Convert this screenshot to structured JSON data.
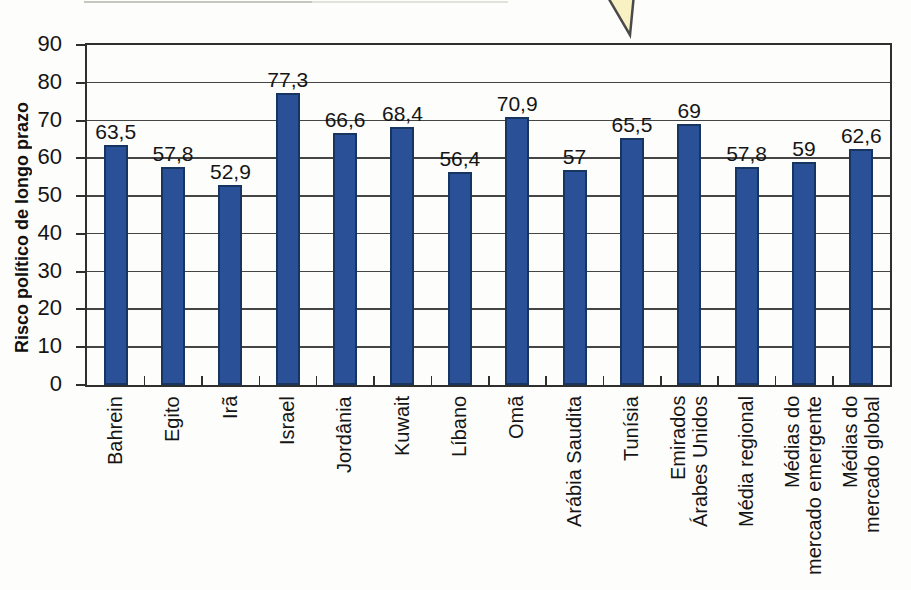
{
  "callout": {
    "arrow_fill": "#f7f1c3",
    "arrow_outline": "#4a4a4a"
  },
  "colors": {
    "bar_fill": "#2a5198",
    "bar_border": "#163561",
    "grid": "#454545",
    "axis": "#2f2f2f"
  },
  "chart_data": {
    "type": "bar",
    "title": "",
    "xlabel": "",
    "ylabel": "Risco político de longo prazo",
    "ylim": [
      0,
      90
    ],
    "ytick_step": 10,
    "yticks": [
      0,
      10,
      20,
      30,
      40,
      50,
      60,
      70,
      80,
      90
    ],
    "grid": true,
    "legend": false,
    "categories": [
      "Bahrein",
      "Egito",
      "Irã",
      "Israel",
      "Jordânia",
      "Kuwait",
      "Líbano",
      "Omã",
      "Arábia Saudita",
      "Tunísia",
      "Emirados\nÁrabes Unidos",
      "Média regional",
      "Médias do\nmercado emergente",
      "Médias do\nmercado global"
    ],
    "values": [
      63.5,
      57.8,
      52.9,
      77.3,
      66.6,
      68.4,
      56.4,
      70.9,
      57,
      65.5,
      69,
      57.8,
      59,
      62.6
    ],
    "value_labels": [
      "63,5",
      "57,8",
      "52,9",
      "77,3",
      "66,6",
      "68,4",
      "56,4",
      "70,9",
      "57",
      "65,5",
      "69",
      "57,8",
      "59",
      "62,6"
    ]
  }
}
